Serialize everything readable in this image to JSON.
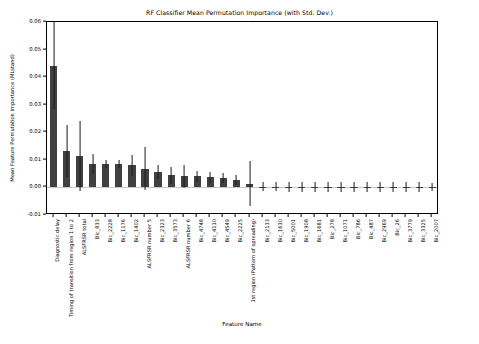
{
  "chart_data": {
    "type": "bar",
    "title": "RF Classifier Mean Permutation Importance (with Std. Dev.)",
    "xlabel": "Feature Name",
    "ylabel": "Mean Feature Permutation Importance (MLstand)",
    "ylim": [
      -0.01,
      0.06
    ],
    "yticks": [
      -0.01,
      0.0,
      0.01,
      0.02,
      0.03,
      0.04,
      0.05,
      0.06
    ],
    "ytick_labels": [
      "-0.01",
      "0.00",
      "0.01",
      "0.02",
      "0.03",
      "0.04",
      "0.05",
      "0.06"
    ],
    "grid": false,
    "legend": "none",
    "bar_color": "#404040",
    "errorbar_color": "#1a1a1a",
    "categories": [
      "Diagnostic delay",
      "Timing of transition from region 1 to 2",
      "ALSFRSR total",
      "Bic_833",
      "Bic_2228",
      "Bic_1176",
      "Bic_1402",
      "ALSFRSR number 5",
      "Bic_2323",
      "Bic_3573",
      "ALSFRSR number 6",
      "Bic_4748",
      "Bic_4110",
      "Bic_4549",
      "Bic_2225",
      "1st region (Pattern of spreading)",
      "Bic_2133",
      "Bic_1630",
      "Bic_5001",
      "Bic_1908",
      "Bic_1681",
      "Bic_278",
      "Bic_1071",
      "Bic_786",
      "Bic_487",
      "Bic_2969",
      "Bic_26",
      "Bic_3779",
      "Bic_3325",
      "Bic_2007"
    ],
    "values": [
      0.0442,
      0.0133,
      0.0114,
      0.0086,
      0.0085,
      0.0085,
      0.008,
      0.0068,
      0.0057,
      0.0044,
      0.004,
      0.004,
      0.0037,
      0.0034,
      0.0026,
      0.0014,
      0.0003,
      0.0003,
      0.0002,
      0.0002,
      0.0002,
      0.0002,
      0.0002,
      0.0002,
      0.0001,
      0.0001,
      0.0001,
      0.0001,
      0.0001,
      0.0001
    ],
    "errors": [
      0.0158,
      0.0095,
      0.0128,
      0.0036,
      0.0013,
      0.0013,
      0.0038,
      0.0078,
      0.0025,
      0.003,
      0.0043,
      0.002,
      0.002,
      0.0018,
      0.0018,
      0.0082,
      0.0017,
      0.0017,
      0.0017,
      0.0017,
      0.0017,
      0.0017,
      0.0017,
      0.0017,
      0.0017,
      0.0017,
      0.0017,
      0.0017,
      0.0017,
      0.0014
    ]
  }
}
